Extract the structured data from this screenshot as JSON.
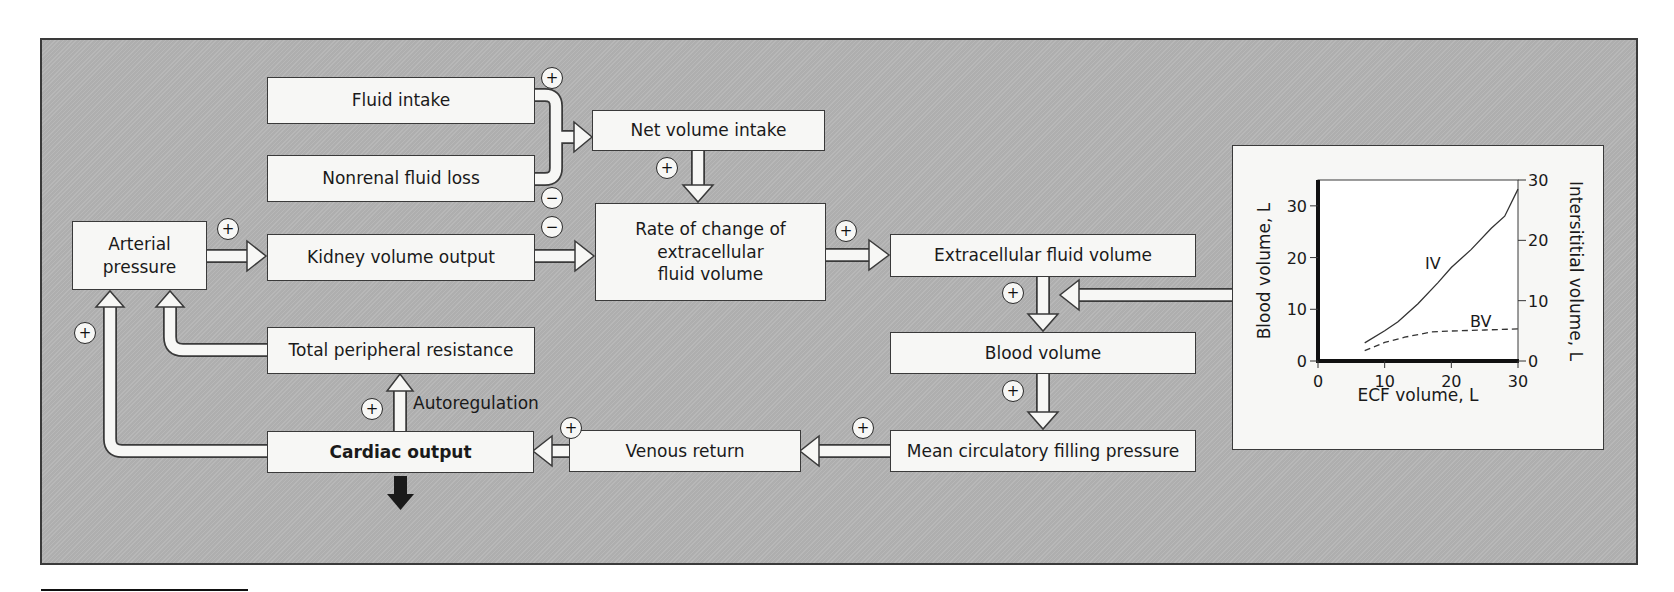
{
  "diagram": {
    "title": "",
    "colors": {
      "panel_bg": "#b4b4b4",
      "box_bg": "#f7f7f5",
      "border": "#3a3a3a",
      "output_arrow": "#1a1a1a"
    },
    "boxes": {
      "fluid_intake": "Fluid intake",
      "nonrenal_fluid_loss": "Nonrenal fluid loss",
      "net_volume_intake": "Net volume intake",
      "arterial_pressure_line1": "Arterial",
      "arterial_pressure_line2": "pressure",
      "kidney_volume_output": "Kidney volume output",
      "rate_of_change_line1": "Rate of change of",
      "rate_of_change_line2": "extracellular",
      "rate_of_change_line3": "fluid volume",
      "extracellular_fluid_volume": "Extracellular fluid volume",
      "blood_volume": "Blood volume",
      "total_peripheral_resistance": "Total peripheral resistance",
      "mean_circulatory_filling_pressure": "Mean circulatory filling pressure",
      "venous_return": "Venous return",
      "cardiac_output": "Cardiac output"
    },
    "annotations": {
      "autoregulation": "Autoregulation"
    },
    "signs": {
      "plus": "+",
      "minus": "−"
    }
  },
  "chart_data": {
    "type": "line",
    "title": "",
    "xlabel": "ECF volume, L",
    "ylabel": "Blood volume, L",
    "ylabel_right": "Intersititial volume, L",
    "xlim": [
      0,
      30
    ],
    "ylim": [
      0,
      35
    ],
    "ylim_right": [
      0,
      30
    ],
    "x_ticks": [
      "0",
      "10",
      "20",
      "30"
    ],
    "y_ticks": [
      "0",
      "10",
      "20",
      "30"
    ],
    "y_ticks_right": [
      "0",
      "10",
      "20",
      "30"
    ],
    "grid": false,
    "legend": "inline labels",
    "series": [
      {
        "name": "IV",
        "style": "solid",
        "axis": "right",
        "x": [
          7,
          10,
          12,
          15,
          18,
          20,
          23,
          26,
          28,
          30
        ],
        "values": [
          3.0,
          5.0,
          6.5,
          9.5,
          13.0,
          15.5,
          18.5,
          22.0,
          24.0,
          28.5
        ]
      },
      {
        "name": "BV",
        "style": "dashed",
        "axis": "left",
        "x": [
          7,
          10,
          13,
          17,
          20,
          25,
          30
        ],
        "values": [
          2.0,
          3.6,
          4.6,
          5.6,
          5.8,
          6.0,
          6.2
        ]
      }
    ],
    "annotations": [
      "IV",
      "BV"
    ]
  }
}
